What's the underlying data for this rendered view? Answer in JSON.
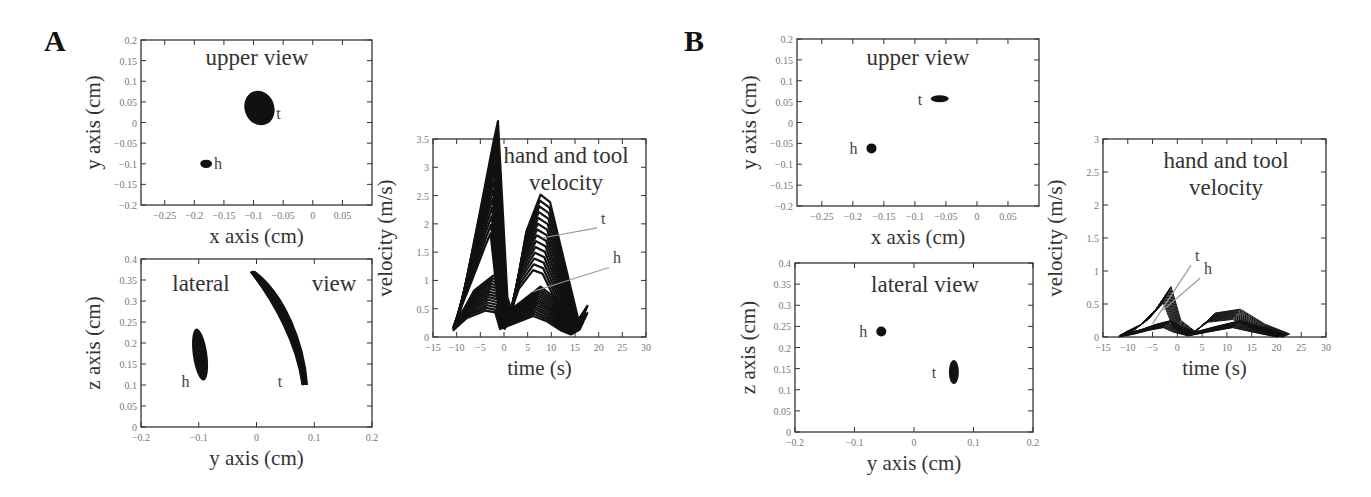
{
  "panels": {
    "A": {
      "label": "A"
    },
    "B": {
      "label": "B"
    }
  },
  "chart_data": [
    {
      "panel": "A",
      "type": "scatter",
      "title": "upper view",
      "xlabel": "x axis (cm)",
      "ylabel": "y axis (cm)",
      "xlim": [
        -0.29,
        0.1
      ],
      "ylim": [
        -0.2,
        0.2
      ],
      "xticks": [
        "-0.25",
        "-0.2",
        "-0.15",
        "-0.1",
        "-0.05",
        "0",
        "0.05"
      ],
      "yticks": [
        "-0.2",
        "-0.15",
        "-0.1",
        "-0.05",
        "0",
        "0.05",
        "0.1",
        "0.15",
        "0.2"
      ],
      "series": [
        {
          "name": "h",
          "label": "h",
          "cluster_center": [
            -0.18,
            -0.1
          ],
          "extent_x": [
            -0.19,
            -0.17
          ],
          "extent_y": [
            -0.11,
            -0.09
          ]
        },
        {
          "name": "t",
          "label": "t",
          "cluster_center": [
            -0.09,
            0.035
          ],
          "extent_x": [
            -0.11,
            -0.06
          ],
          "extent_y": [
            -0.01,
            0.075
          ]
        }
      ]
    },
    {
      "panel": "A",
      "type": "line",
      "title": "lateral view",
      "title_parts": [
        "lateral",
        "view"
      ],
      "xlabel": "y axis (cm)",
      "ylabel": "z axis (cm)",
      "xlim": [
        -0.2,
        0.2
      ],
      "ylim": [
        0,
        0.4
      ],
      "xticks": [
        "-0.2",
        "-0.1",
        "0",
        "0.1",
        "0.2"
      ],
      "yticks": [
        "0",
        "0.05",
        "0.1",
        "0.15",
        "0.2",
        "0.25",
        "0.3",
        "0.35",
        "0.4"
      ],
      "series": [
        {
          "name": "h",
          "label": "h",
          "extent_x": [
            -0.11,
            -0.085
          ],
          "extent_z": [
            0.11,
            0.235
          ]
        },
        {
          "name": "t",
          "label": "t",
          "path": [
            [
              -0.01,
              0.37
            ],
            [
              0.03,
              0.3
            ],
            [
              0.07,
              0.2
            ],
            [
              0.08,
              0.1
            ]
          ]
        }
      ]
    },
    {
      "panel": "A",
      "type": "line",
      "title": "hand and tool velocity",
      "title_lines": [
        "hand and tool",
        "velocity"
      ],
      "xlabel": "time (s)",
      "ylabel": "velocity (m/s)",
      "xlim": [
        -15,
        30
      ],
      "ylim": [
        0,
        3.5
      ],
      "xticks": [
        "-15",
        "-10",
        "-5",
        "0",
        "5",
        "10",
        "15",
        "20",
        "25",
        "30"
      ],
      "yticks": [
        "0",
        "0.5",
        "1",
        "1.5",
        "2",
        "2.5",
        "3",
        "3.5"
      ],
      "series": [
        {
          "name": "t",
          "label": "t",
          "x": [
            -10,
            -6,
            -3,
            -2,
            0,
            1,
            4,
            7,
            9,
            12,
            15,
            17
          ],
          "y": [
            0.3,
            1.6,
            2.6,
            2.9,
            0.5,
            0.3,
            1.4,
            1.9,
            1.8,
            1.0,
            0.2,
            0.4
          ]
        },
        {
          "name": "h",
          "label": "h",
          "x": [
            -10,
            -7,
            -3,
            -1,
            0,
            1,
            3,
            7,
            10,
            13,
            15,
            17
          ],
          "y": [
            0.25,
            0.6,
            0.8,
            0.75,
            0.3,
            0.35,
            0.45,
            0.65,
            0.5,
            0.25,
            0.15,
            0.3
          ]
        }
      ],
      "annotations": [
        {
          "text": "t",
          "arrow_to": [
            8,
            1.75
          ]
        },
        {
          "text": "h",
          "arrow_to": [
            6,
            0.8
          ]
        }
      ]
    },
    {
      "panel": "B",
      "type": "scatter",
      "title": "upper view",
      "xlabel": "x axis (cm)",
      "ylabel": "y axis (cm)",
      "xlim": [
        -0.29,
        0.1
      ],
      "ylim": [
        -0.2,
        0.2
      ],
      "xticks": [
        "-0.25",
        "-0.2",
        "-0.15",
        "-0.1",
        "-0.05",
        "0",
        "0.05"
      ],
      "yticks": [
        "-0.2",
        "-0.15",
        "-0.1",
        "-0.05",
        "0",
        "0.05",
        "0.1",
        "0.15",
        "0.2"
      ],
      "series": [
        {
          "name": "h",
          "label": "h",
          "cluster_center": [
            -0.17,
            -0.062
          ]
        },
        {
          "name": "t",
          "label": "t",
          "cluster_center": [
            -0.06,
            0.057
          ]
        }
      ]
    },
    {
      "panel": "B",
      "type": "scatter",
      "title": "lateral view",
      "xlabel": "y axis (cm)",
      "ylabel": "z axis (cm)",
      "xlim": [
        -0.2,
        0.2
      ],
      "ylim": [
        0,
        0.4
      ],
      "xticks": [
        "-0.2",
        "-0.1",
        "0",
        "0.1",
        "0.2"
      ],
      "yticks": [
        "0",
        "0.05",
        "0.1",
        "0.15",
        "0.2",
        "0.25",
        "0.3",
        "0.35",
        "0.4"
      ],
      "series": [
        {
          "name": "h",
          "label": "h",
          "cluster_center": [
            -0.055,
            0.238
          ]
        },
        {
          "name": "t",
          "label": "t",
          "cluster_center": [
            0.067,
            0.142
          ]
        }
      ]
    },
    {
      "panel": "B",
      "type": "line",
      "title": "hand and tool velocity",
      "title_lines": [
        "hand and tool",
        "velocity"
      ],
      "xlabel": "time (s)",
      "ylabel": "velocity (m/s)",
      "xlim": [
        -15,
        30
      ],
      "ylim": [
        0,
        3
      ],
      "xticks": [
        "-15",
        "-10",
        "-5",
        "0",
        "5",
        "10",
        "15",
        "20",
        "25",
        "30"
      ],
      "yticks": [
        "0",
        "0.5",
        "1",
        "1.5",
        "2",
        "2.5",
        "3"
      ],
      "series": [
        {
          "name": "t",
          "label": "t",
          "x": [
            -11,
            -8,
            -5,
            -2,
            0,
            3,
            7,
            12,
            17,
            22
          ],
          "y": [
            0.05,
            0.15,
            0.35,
            0.65,
            0.2,
            0.05,
            0.3,
            0.35,
            0.15,
            0.02
          ]
        },
        {
          "name": "h",
          "label": "h",
          "x": [
            -11,
            -8,
            -5,
            -2,
            0,
            3,
            7,
            12,
            17,
            21
          ],
          "y": [
            0.03,
            0.08,
            0.15,
            0.2,
            0.12,
            0.05,
            0.12,
            0.2,
            0.1,
            0.02
          ]
        }
      ],
      "annotations": [
        {
          "text": "t",
          "arrow_to": [
            -5,
            0.2
          ]
        },
        {
          "text": "h",
          "arrow_to": [
            -3,
            0.4
          ]
        }
      ]
    }
  ]
}
